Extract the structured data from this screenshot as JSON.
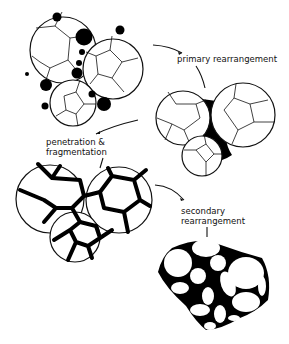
{
  "diagram": {
    "type": "process-stages",
    "labels": {
      "stage2": "primary rearrangement",
      "stage3_line1": "penetration &",
      "stage3_line2": "fragmentation",
      "stage4_line1": "secondary",
      "stage4_line2": "rearrangement"
    },
    "stages": [
      {
        "id": 1,
        "description": "three polycrystalline particles with liquid droplets (black) at contacts"
      },
      {
        "id": 2,
        "description": "particles pulled together, liquid filling necks",
        "label_ref": "primary rearrangement"
      },
      {
        "id": 3,
        "description": "liquid penetrates grain boundaries (thick black lines)",
        "label_ref": "penetration & fragmentation"
      },
      {
        "id": 4,
        "description": "fragmented grains rearrange into densified cluster",
        "label_ref": "secondary rearrangement"
      }
    ],
    "colors": {
      "ink": "#111111",
      "background": "#ffffff"
    }
  }
}
